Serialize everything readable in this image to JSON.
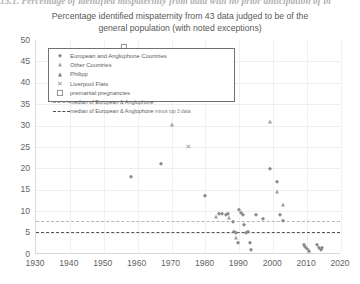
{
  "clipped_caption": "13.1. Percentage of identified mispaternity from data with no prior anticipation of bi",
  "chart_data": {
    "type": "scatter",
    "title": "Percentage identified mispaternity from 43 data judged to be of the general population (with noted exceptions)",
    "title_line1": "Percentage identified mispaternity from 43 data judged to be of the",
    "title_line2": "general population (with noted exceptions)",
    "xlabel": "",
    "ylabel": "",
    "xlim": [
      1930,
      2020
    ],
    "ylim": [
      0,
      50
    ],
    "xticks": [
      1930,
      1940,
      1950,
      1960,
      1970,
      1980,
      1990,
      2000,
      2010,
      2020
    ],
    "yticks": [
      0,
      5,
      10,
      15,
      20,
      25,
      30,
      35,
      40,
      45,
      50
    ],
    "grid": true,
    "legend_position": "upper-left-inside",
    "series": [
      {
        "name": "European and Anglophone Countries",
        "marker": "diamond",
        "color": "#8b8b8b",
        "points": [
          [
            1958,
            18.0
          ],
          [
            1967,
            21.0
          ],
          [
            1980,
            13.5
          ],
          [
            1984,
            9.3
          ],
          [
            1985,
            9.4
          ],
          [
            1986,
            9.2
          ],
          [
            1986.8,
            9.3
          ],
          [
            1988,
            7.5
          ],
          [
            1988.5,
            5.2
          ],
          [
            1989,
            5.0
          ],
          [
            1989.5,
            2.6
          ],
          [
            1990,
            10.2
          ],
          [
            1990.5,
            9.6
          ],
          [
            1991,
            9.0
          ],
          [
            1991.5,
            6.8
          ],
          [
            1992,
            5.0
          ],
          [
            1992.5,
            5.1
          ],
          [
            1993,
            2.6
          ],
          [
            1993.5,
            1.0
          ],
          [
            1995,
            9.2
          ],
          [
            1997,
            8.2
          ],
          [
            1999,
            19.8
          ],
          [
            2001,
            16.8
          ],
          [
            2002,
            9.0
          ],
          [
            2003,
            7.6
          ],
          [
            2009,
            2.0
          ],
          [
            2009.4,
            1.6
          ],
          [
            2010,
            1.2
          ],
          [
            2013,
            2.0
          ],
          [
            2013.6,
            1.5
          ],
          [
            2014,
            1.0
          ],
          [
            2014.5,
            1.3
          ]
        ]
      },
      {
        "name": "Other Countries",
        "marker": "triangle",
        "color": "#a0a0a0",
        "points": [
          [
            1970,
            30.2
          ],
          [
            1983,
            8.6
          ],
          [
            1987,
            8.4
          ],
          [
            1989,
            3.8
          ],
          [
            1999,
            30.8
          ],
          [
            2001,
            14.6
          ],
          [
            2003,
            11.4
          ]
        ]
      },
      {
        "name": "Philipp",
        "marker": "triangle-dark",
        "color": "#7b7b7b",
        "points": [
          [
            2010.5,
            0.6
          ]
        ]
      },
      {
        "name": "Liverpool Flats",
        "marker": "x",
        "color": "#8f8f8f",
        "points": [
          [
            1975,
            25.0
          ]
        ]
      },
      {
        "name": "premarital pregnancies",
        "marker": "square-open",
        "color": "#8f8f8f",
        "points": [
          [
            1956,
            48.4
          ]
        ]
      }
    ],
    "reference_lines": [
      {
        "name": "median of European & Anglophone",
        "value": 7.6,
        "style": "dashed-light",
        "color": "#b6b6b6"
      },
      {
        "name": "median of European & Anglophone minus top 3 data",
        "value": 5.1,
        "style": "dashed-dark",
        "color": "#555555"
      }
    ]
  },
  "legend": {
    "items": [
      {
        "label": "European and Anglophone Countries",
        "marker": "diamond"
      },
      {
        "label": "Other Countries",
        "marker": "triangle"
      },
      {
        "label": "Philipp",
        "marker": "triangle-dark"
      },
      {
        "label": "Liverpool Flats",
        "marker": "x"
      },
      {
        "label": "premarital pregnancies",
        "marker": "square-open"
      },
      {
        "label": "median of European & Anglophone",
        "marker": "line-light"
      },
      {
        "label": "median of European & Anglophone",
        "label_suffix": "minus top 3 data",
        "marker": "line-dark"
      }
    ]
  },
  "colors": {
    "axis": "#d9d9d9",
    "grid": "#eeeeee",
    "text": "#5d5d5d",
    "marker": "#8b8b8b",
    "median_light": "#b6b6b6",
    "median_dark": "#555555"
  }
}
